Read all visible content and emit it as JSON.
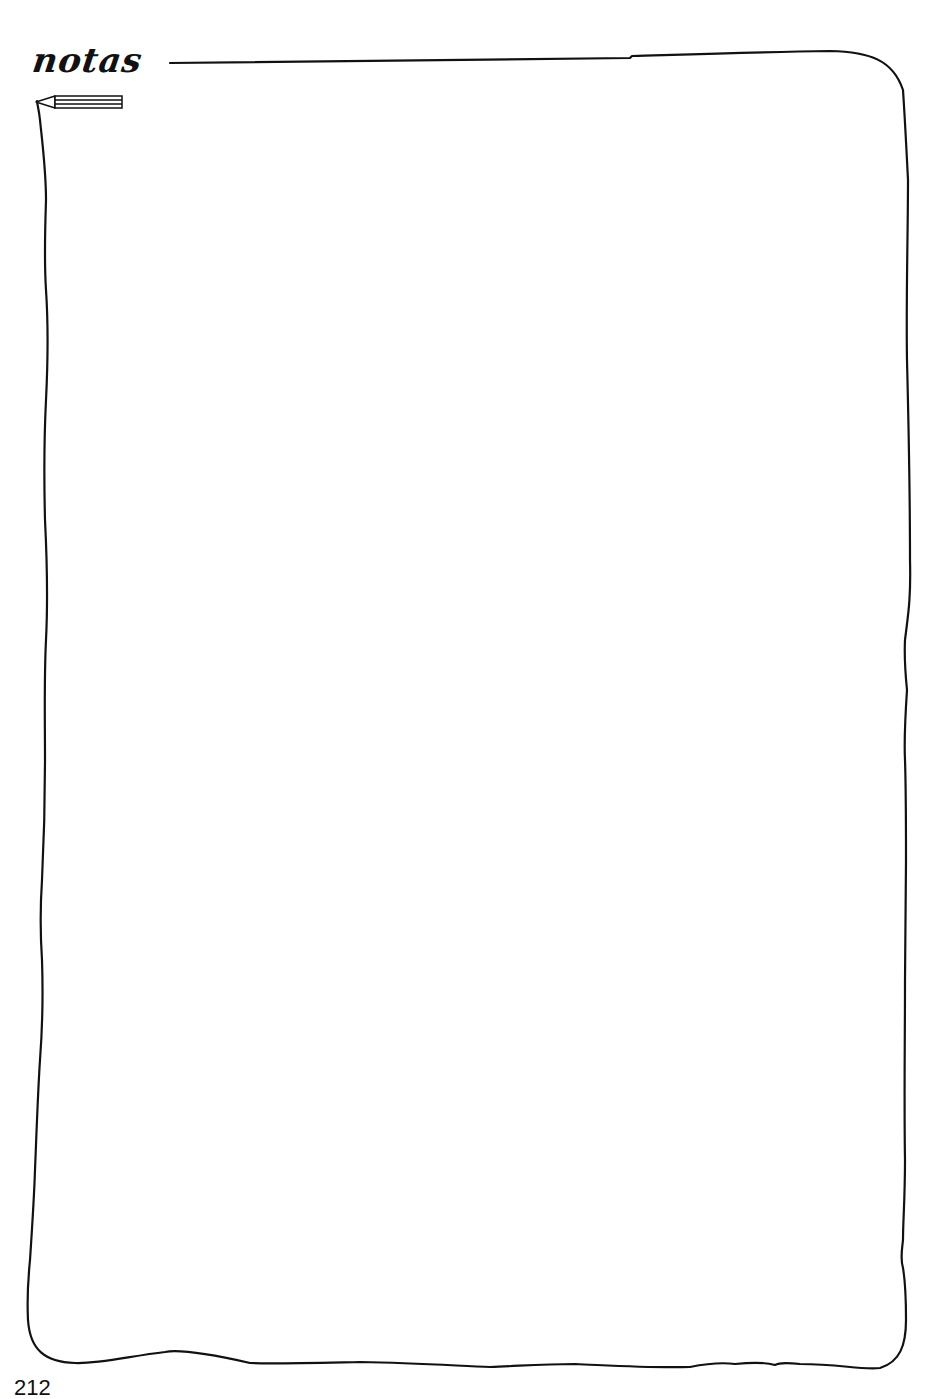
{
  "page": {
    "heading": "notas",
    "page_number": "212",
    "colors": {
      "ink": "#111111",
      "paper": "#ffffff"
    }
  },
  "icons": {
    "pencil": "pencil-icon"
  },
  "notes_area": {
    "content": ""
  }
}
